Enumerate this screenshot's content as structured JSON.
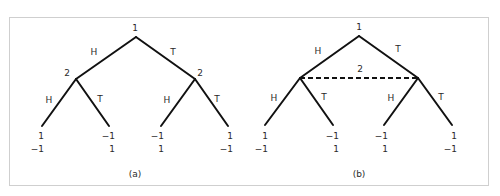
{
  "figure": {
    "border_color": "#cfcfcf",
    "line_color": "#111111",
    "panels": [
      {
        "id": "a",
        "caption": "(a)",
        "root": {
          "player": "1"
        },
        "level1": {
          "left_player": "2",
          "right_player": "2",
          "information_set": false
        },
        "edge_labels": {
          "root_left": "H",
          "root_right": "T",
          "left_left": "H",
          "left_right": "T",
          "right_left": "H",
          "right_right": "T"
        },
        "payoffs": [
          {
            "p1": "1",
            "p2": "−1"
          },
          {
            "p1": "−1",
            "p2": "1"
          },
          {
            "p1": "−1",
            "p2": "1"
          },
          {
            "p1": "1",
            "p2": "−1"
          }
        ]
      },
      {
        "id": "b",
        "caption": "(b)",
        "root": {
          "player": "1"
        },
        "level1": {
          "information_set_player": "2",
          "information_set": true
        },
        "edge_labels": {
          "root_left": "H",
          "root_right": "T",
          "left_left": "H",
          "left_right": "T",
          "right_left": "H",
          "right_right": "T"
        },
        "payoffs": [
          {
            "p1": "1",
            "p2": "−1"
          },
          {
            "p1": "−1",
            "p2": "1"
          },
          {
            "p1": "−1",
            "p2": "1"
          },
          {
            "p1": "1",
            "p2": "−1"
          }
        ]
      }
    ]
  }
}
